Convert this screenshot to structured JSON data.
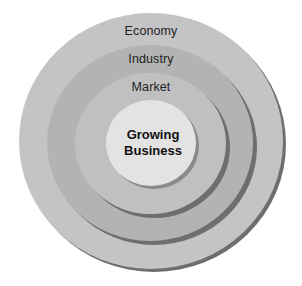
{
  "diagram": {
    "type": "concentric-circles",
    "rings": [
      {
        "label": "Economy",
        "color": "#c4c4c4"
      },
      {
        "label": "Industry",
        "color": "#b4b4b4"
      },
      {
        "label": "Market",
        "color": "#bfbfbf"
      }
    ],
    "center": {
      "line1": "Growing",
      "line2": "Business",
      "color": "#e2e2e2"
    },
    "shadow_color": "#6e6e6e"
  }
}
